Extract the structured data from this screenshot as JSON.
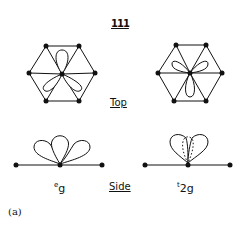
{
  "diagram": {
    "title": "111",
    "top_view_label": "Top",
    "side_view_label": "Side",
    "panels": [
      {
        "id": "eg",
        "label_prefix": "e",
        "label_sub": "g",
        "top_view": {
          "lobes": 3,
          "orientation": "one lobe up, two lobes down-left and down-right toward the left"
        },
        "side_view": {
          "lobes": 3,
          "description": "three lobes above the bond line, spread fan-wise"
        }
      },
      {
        "id": "t2g",
        "label_prefix": "t",
        "label_sub": "2g",
        "top_view": {
          "lobes": 3,
          "orientation": "two lobes up-left and up-right, one lobe down"
        },
        "side_view": {
          "lobes": 3,
          "description": "lobes above bond line, middle lobe dashed (behind)"
        }
      }
    ],
    "caption": "(a)",
    "colors": {
      "line": "#111111",
      "background": "#ffffff"
    }
  }
}
